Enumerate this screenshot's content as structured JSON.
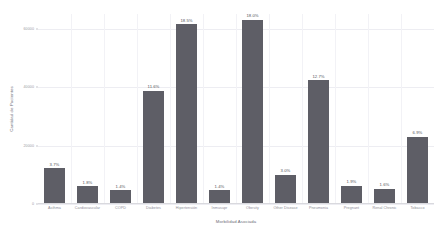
{
  "chart_data": {
    "type": "bar",
    "title": "",
    "xlabel": "Morbilidad Asociada",
    "ylabel": "Cantidad de Pacientes",
    "ylim": [
      0,
      65000
    ],
    "grid": true,
    "legend_position": "none",
    "bar_color": "#5e5e66",
    "categories": [
      "Asthma",
      "Cardiovascular",
      "COPD",
      "Diabetes",
      "Hipertensión",
      "Inmusupr",
      "Obesity",
      "Other Disease",
      "Pneumonia",
      "Pregnant",
      "Renal Chronic",
      "Tobacco"
    ],
    "values": [
      12300,
      6000,
      4700,
      38700,
      61500,
      4700,
      63000,
      10000,
      42300,
      6300,
      5300,
      23000
    ],
    "data_labels": [
      "3.7%",
      "1.8%",
      "1.4%",
      "11.6%",
      "18.5%",
      "1.4%",
      "18.0%",
      "3.0%",
      "12.7%",
      "1.9%",
      "1.6%",
      "6.9%"
    ],
    "yticks": [
      0,
      20000,
      40000,
      60000
    ],
    "ytick_labels": [
      "0",
      "20000",
      "40000",
      "60000"
    ]
  }
}
